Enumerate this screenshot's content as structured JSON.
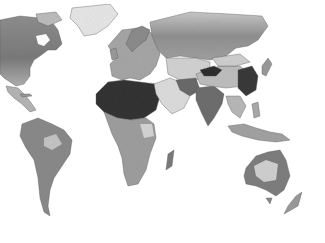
{
  "map": {
    "type": "world-choropleth",
    "projection": "equirectangular",
    "palette": "grayscale",
    "background": "#ffffff",
    "colors": {
      "low": "#e8e8e8",
      "mid": "#a8a8a8",
      "high": "#808080",
      "very_high": "#2e2e2e",
      "border": "#5a5a5a"
    },
    "regions": [
      {
        "name": "North America",
        "tone": "mid"
      },
      {
        "name": "Greenland",
        "tone": "low"
      },
      {
        "name": "Central America",
        "tone": "mid"
      },
      {
        "name": "South America",
        "tone": "mid"
      },
      {
        "name": "Europe",
        "tone": "mid"
      },
      {
        "name": "Africa (Sahara)",
        "tone": "very_high"
      },
      {
        "name": "Africa (South)",
        "tone": "mid"
      },
      {
        "name": "Madagascar",
        "tone": "high"
      },
      {
        "name": "Russia",
        "tone": "mid"
      },
      {
        "name": "Middle East / Arabia",
        "tone": "low"
      },
      {
        "name": "Central Asia",
        "tone": "low"
      },
      {
        "name": "China (Taklamakan)",
        "tone": "very_high"
      },
      {
        "name": "East China",
        "tone": "very_high"
      },
      {
        "name": "India",
        "tone": "high"
      },
      {
        "name": "Southeast Asia",
        "tone": "mid"
      },
      {
        "name": "Australia",
        "tone": "high"
      },
      {
        "name": "New Zealand",
        "tone": "mid"
      }
    ]
  }
}
